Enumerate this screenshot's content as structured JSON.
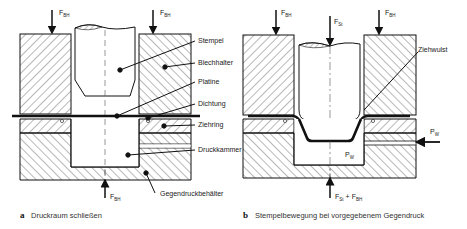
{
  "diagram": {
    "panels": [
      {
        "id": "a",
        "caption_letter": "a",
        "caption": "Druckraum schließen",
        "forces": {
          "top_left": {
            "symbol": "F",
            "subscript": "BH"
          },
          "top_right": {
            "symbol": "F",
            "subscript": "BH"
          },
          "bottom": {
            "symbol": "F",
            "subscript": "BH"
          }
        },
        "labels": [
          "Stempel",
          "Blechhalter",
          "Platine",
          "Dichtung",
          "Ziehring",
          "Druckkammer",
          "Gegendruckbehälter"
        ]
      },
      {
        "id": "b",
        "caption_letter": "b",
        "caption": "Stempelbewegung bei vorgegebenem Gegendruck",
        "forces": {
          "top_left": {
            "symbol": "F",
            "subscript": "BH"
          },
          "top_center": {
            "symbol": "F",
            "subscript": "St"
          },
          "top_right": {
            "symbol": "F",
            "subscript": "BH"
          },
          "bottom": {
            "symbol": "F",
            "subscript1": "St",
            "plus": "+",
            "subscript2": "BH"
          },
          "side_pressure": {
            "symbol": "P",
            "subscript": "W"
          }
        },
        "chamber_pressure": {
          "symbol": "P",
          "subscript": "W"
        },
        "labels": [
          "Ziehwulst"
        ]
      }
    ]
  }
}
